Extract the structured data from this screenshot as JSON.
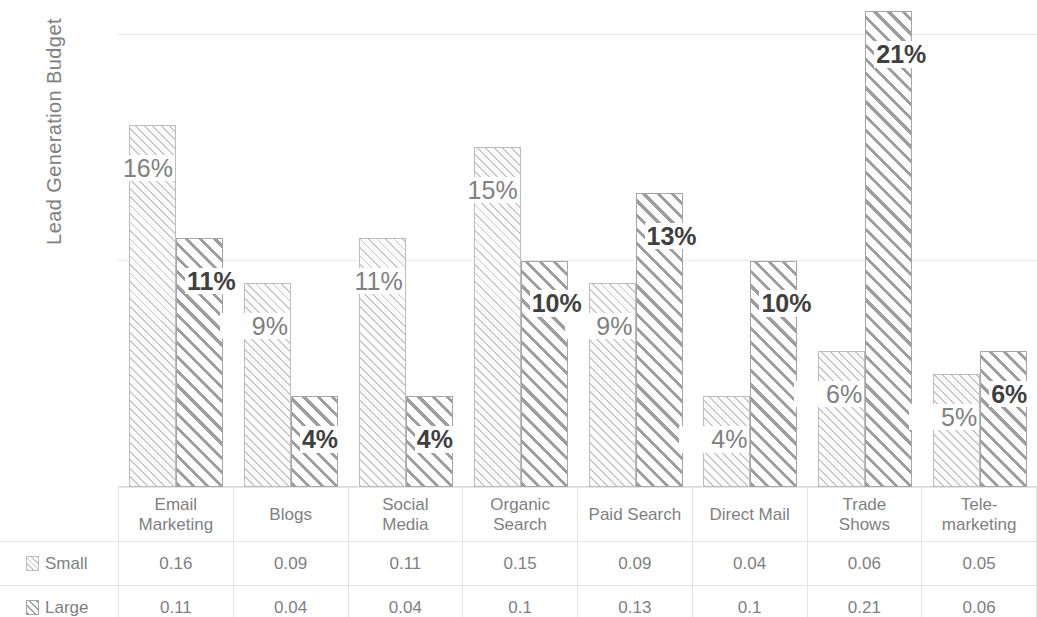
{
  "chart_data": {
    "type": "bar",
    "title": "",
    "subtitle": "",
    "xlabel": "",
    "ylabel": "Lead Generation Budget",
    "categories": [
      "Email Marketing",
      "Blogs",
      "Social Media",
      "Organic Search",
      "Paid Search",
      "Direct Mail",
      "Trade Shows",
      "Tele-marketing"
    ],
    "series": [
      {
        "name": "Small",
        "values": [
          0.16,
          0.09,
          0.11,
          0.15,
          0.09,
          0.04,
          0.06,
          0.05
        ],
        "labels": [
          "16%",
          "9%",
          "11%",
          "15%",
          "9%",
          "4%",
          "6%",
          "5%"
        ],
        "table_values": [
          "0.16",
          "0.09",
          "0.11",
          "0.15",
          "0.09",
          "0.04",
          "0.06",
          "0.05"
        ],
        "swatch": "hatch-light-swatch"
      },
      {
        "name": "Large",
        "values": [
          0.11,
          0.04,
          0.04,
          0.1,
          0.13,
          0.1,
          0.21,
          0.06
        ],
        "labels": [
          "11%",
          "4%",
          "4%",
          "10%",
          "13%",
          "10%",
          "21%",
          "6%"
        ],
        "table_values": [
          "0.11",
          "0.04",
          "0.04",
          "0.1",
          "0.13",
          "0.1",
          "0.21",
          "0.06"
        ],
        "swatch": "hatch-dark-swatch"
      }
    ],
    "ylim": [
      0,
      0.215
    ],
    "yticks": [
      0,
      0.1,
      0.2
    ],
    "ytick_labels": [
      "0%",
      "10%",
      "20%"
    ],
    "grid": true,
    "legend_position": "data-table",
    "data_table_visible": true,
    "colors": {
      "axis_text": "#595959",
      "axis_title": "#808080",
      "gridline": "#e8e8e8",
      "small_series": "#c9c9c9",
      "large_series": "#9e9e9e",
      "table_text": "#7f7f7f",
      "table_border": "#e4e4e4"
    }
  }
}
